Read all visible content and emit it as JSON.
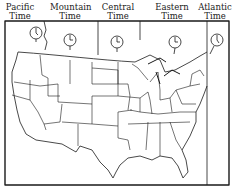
{
  "zones": [
    {
      "name": "Pacific",
      "line2": "Time",
      "x": 18
    },
    {
      "name": "Mountain",
      "line2": "Time",
      "x": 69
    },
    {
      "name": "Central",
      "line2": "Time",
      "x": 117
    },
    {
      "name": "Eastern",
      "line2": "Time",
      "x": 171
    },
    {
      "name": "Atlantic",
      "line2": "Time",
      "x": 214
    }
  ],
  "clocks": [
    {
      "zone": "Pacific",
      "hour": 12,
      "minute": 30
    },
    {
      "zone": "Mountain",
      "hour": 1,
      "minute": 15
    },
    {
      "zone": "Central",
      "hour": 2,
      "minute": 15
    },
    {
      "zone": "Eastern",
      "hour": 3,
      "minute": 15
    },
    {
      "zone": "Atlantic",
      "hour": 4,
      "minute": 30
    }
  ],
  "colors": {
    "line": "#1a1a1a",
    "background": "#ffffff"
  }
}
